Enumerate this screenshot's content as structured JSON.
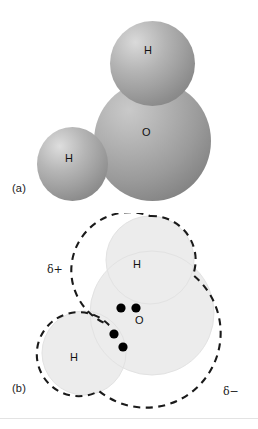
{
  "figure": {
    "background_color": "#ffffff"
  },
  "panels": [
    {
      "id": "a",
      "label": "(a)",
      "caption_role": "space-filling model",
      "atoms": [
        {
          "symbol": "H",
          "name": "hydrogen-top"
        },
        {
          "symbol": "O",
          "name": "oxygen-center"
        },
        {
          "symbol": "H",
          "name": "hydrogen-left"
        }
      ],
      "colors": {
        "sphere_light": "#dadada",
        "sphere_mid": "#a8a8a8",
        "sphere_dark": "#767676"
      }
    },
    {
      "id": "b",
      "label": "(b)",
      "caption_role": "charge distribution with lone pairs",
      "atoms": [
        {
          "symbol": "H",
          "name": "hydrogen-top"
        },
        {
          "symbol": "O",
          "name": "oxygen-center"
        },
        {
          "symbol": "H",
          "name": "hydrogen-left"
        }
      ],
      "charges": [
        {
          "symbol": "δ+",
          "name": "partial-positive",
          "position": "upper-left"
        },
        {
          "symbol": "δ−",
          "name": "partial-negative",
          "position": "lower-right"
        }
      ],
      "lone_pairs": [
        {
          "name": "lone-pair-upper",
          "electrons": 2
        },
        {
          "name": "lone-pair-lower-left",
          "electrons": 2
        }
      ],
      "electron_count": 4,
      "colors": {
        "cloud_fill": "#ececec",
        "outline": "#1a1a1a",
        "electron_dot": "#000000"
      },
      "outline_style": "dashed"
    }
  ]
}
